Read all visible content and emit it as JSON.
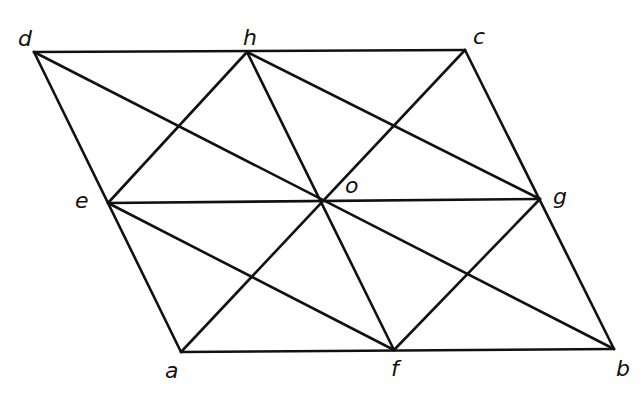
{
  "figure": {
    "title": "",
    "points": {
      "d": {
        "label": "d",
        "x": 34,
        "y": 52,
        "lx": 18,
        "ly": 46
      },
      "h": {
        "label": "h",
        "x": 247,
        "y": 52,
        "lx": 243,
        "ly": 45
      },
      "c": {
        "label": "c",
        "x": 465,
        "y": 50,
        "lx": 473,
        "ly": 44
      },
      "e": {
        "label": "e",
        "x": 108,
        "y": 203,
        "lx": 75,
        "ly": 208
      },
      "o": {
        "label": "o",
        "x": 320,
        "y": 200,
        "lx": 345,
        "ly": 193
      },
      "g": {
        "label": "g",
        "x": 540,
        "y": 199,
        "lx": 553,
        "ly": 204
      },
      "a": {
        "label": "a",
        "x": 181,
        "y": 352,
        "lx": 165,
        "ly": 378
      },
      "f": {
        "label": "f",
        "x": 394,
        "y": 350,
        "lx": 391,
        "ly": 376
      },
      "b": {
        "label": "b",
        "x": 614,
        "y": 349,
        "lx": 616,
        "ly": 376
      }
    },
    "segments": [
      [
        "d",
        "c"
      ],
      [
        "c",
        "b"
      ],
      [
        "b",
        "a"
      ],
      [
        "a",
        "d"
      ],
      [
        "e",
        "g"
      ],
      [
        "h",
        "f"
      ],
      [
        "d",
        "b"
      ],
      [
        "c",
        "a"
      ],
      [
        "h",
        "e"
      ],
      [
        "h",
        "g"
      ],
      [
        "e",
        "f"
      ],
      [
        "g",
        "f"
      ]
    ],
    "colors": {
      "stroke": "#111111",
      "background": "#ffffff"
    }
  }
}
